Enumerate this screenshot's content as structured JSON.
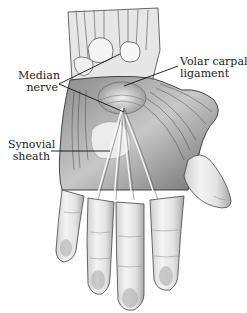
{
  "figure": {
    "labels": [
      {
        "id": "median-nerve",
        "lines": [
          "Median",
          "nerve"
        ]
      },
      {
        "id": "volar-carpal-ligament",
        "lines": [
          "Volar carpal",
          "ligament"
        ]
      },
      {
        "id": "synovial-sheath",
        "lines": [
          "Synovial",
          "sheath"
        ]
      }
    ]
  },
  "colors": {
    "background": "#ffffff",
    "ink": "#1a1a1a",
    "shade_dark": "#555555",
    "shade_mid": "#999999",
    "shade_light": "#d9d9d9"
  }
}
